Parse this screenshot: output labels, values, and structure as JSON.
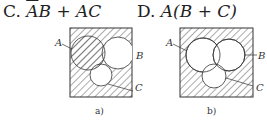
{
  "options": [
    {
      "label": "C.",
      "expr_prefix": "",
      "expr_bar": "A",
      "expr_rest": "B + AC"
    },
    {
      "label": "D.",
      "expr": "A(B + C)"
    }
  ],
  "diagrams": [
    {
      "caption": "a)",
      "labels": {
        "A": "A",
        "B": "B",
        "C": "C"
      }
    },
    {
      "caption": "b)",
      "labels": {
        "A": "A",
        "B": "B",
        "C": "C"
      }
    }
  ]
}
